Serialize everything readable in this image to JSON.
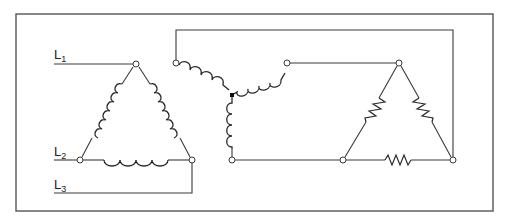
{
  "diagram": {
    "labels": {
      "l1": "L",
      "l1_sub": "1",
      "l2": "L",
      "l2_sub": "2",
      "l3": "L",
      "l3_sub": "3"
    },
    "colors": {
      "line": "#3a3a3a",
      "frame": "#555555",
      "background": "#ffffff"
    },
    "components": {
      "left_delta": "delta-connected inductor coils (3)",
      "middle_wye": "wye-connected inductor coils (3) with common neutral point",
      "right_delta": "delta-connected resistors (3)"
    }
  }
}
